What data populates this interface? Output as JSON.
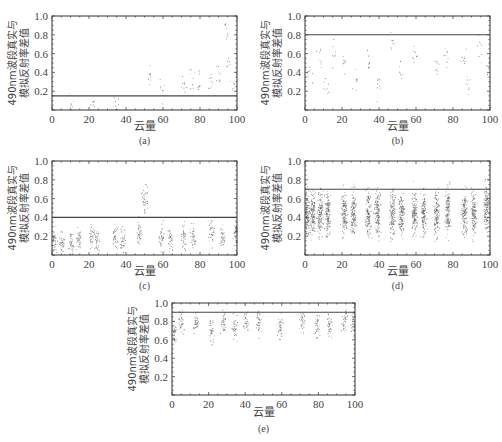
{
  "chart_data": [
    {
      "type": "scatter",
      "panel": "(a)",
      "xlabel": "云量",
      "ylabel": [
        "490nm波段真实与",
        "模拟反射率差值"
      ],
      "xlim": [
        0,
        100
      ],
      "ylim": [
        0,
        1.0
      ],
      "xticks": [
        0,
        20,
        40,
        60,
        80,
        100
      ],
      "yticks": [
        0.2,
        0.4,
        0.6,
        0.8,
        1.0
      ],
      "threshold": 0.15,
      "density": "sparse",
      "clusters": [
        [
          10,
          0.05
        ],
        [
          22,
          0.07
        ],
        [
          35,
          0.05
        ],
        [
          53,
          0.35
        ],
        [
          59,
          0.2
        ],
        [
          71,
          0.25
        ],
        [
          76,
          0.35
        ],
        [
          79,
          0.3
        ],
        [
          86,
          0.3
        ],
        [
          90,
          0.35
        ],
        [
          94,
          0.8
        ],
        [
          95,
          0.45
        ],
        [
          98,
          0.3
        ]
      ]
    },
    {
      "type": "scatter",
      "panel": "(b)",
      "xlabel": "云量",
      "ylabel": [
        "490nm波段真实与",
        "模拟反射率差值"
      ],
      "xlim": [
        0,
        100
      ],
      "ylim": [
        0,
        1.0
      ],
      "xticks": [
        0,
        20,
        40,
        60,
        80,
        100
      ],
      "yticks": [
        0.2,
        0.4,
        0.6,
        0.8,
        1.0
      ],
      "threshold": 0.8,
      "density": "sparse",
      "clusters": [
        [
          3,
          0.4
        ],
        [
          8,
          0.6
        ],
        [
          11,
          0.3
        ],
        [
          15,
          0.6
        ],
        [
          21,
          0.5
        ],
        [
          27,
          0.35
        ],
        [
          34,
          0.55
        ],
        [
          40,
          0.25
        ],
        [
          47,
          0.7
        ],
        [
          52,
          0.45
        ],
        [
          59,
          0.6
        ],
        [
          71,
          0.45
        ],
        [
          76,
          0.55
        ],
        [
          86,
          0.55
        ],
        [
          88,
          0.3
        ],
        [
          94,
          0.65
        ],
        [
          99,
          0.5
        ]
      ]
    },
    {
      "type": "scatter",
      "panel": "(c)",
      "xlabel": "云量",
      "ylabel": [
        "490nm波段真实与",
        "模拟反射率差值"
      ],
      "xlim": [
        0,
        100
      ],
      "ylim": [
        0,
        1.0
      ],
      "xticks": [
        0,
        20,
        40,
        60,
        80,
        100
      ],
      "yticks": [
        0.2,
        0.4,
        0.6,
        0.8,
        1.0
      ],
      "threshold": 0.4,
      "density": "medium",
      "clusters": [
        [
          1,
          0.15
        ],
        [
          5,
          0.15
        ],
        [
          10,
          0.12
        ],
        [
          14,
          0.15
        ],
        [
          21,
          0.2
        ],
        [
          24,
          0.15
        ],
        [
          34,
          0.2
        ],
        [
          38,
          0.15
        ],
        [
          47,
          0.25
        ],
        [
          50,
          0.6
        ],
        [
          59,
          0.2
        ],
        [
          64,
          0.15
        ],
        [
          71,
          0.2
        ],
        [
          76,
          0.2
        ],
        [
          86,
          0.25
        ],
        [
          92,
          0.2
        ],
        [
          99,
          0.25
        ]
      ]
    },
    {
      "type": "scatter",
      "panel": "(d)",
      "xlabel": "云量",
      "ylabel": [
        "490nm波段真实与",
        "模拟反射率差值"
      ],
      "xlim": [
        0,
        100
      ],
      "ylim": [
        0,
        1.0
      ],
      "xticks": [
        0,
        20,
        40,
        60,
        80,
        100
      ],
      "yticks": [
        0.2,
        0.4,
        0.6,
        0.8,
        1.0
      ],
      "threshold": 0.7,
      "density": "dense",
      "clusters": [
        [
          1,
          0.45
        ],
        [
          4,
          0.45
        ],
        [
          8,
          0.45
        ],
        [
          12,
          0.45
        ],
        [
          21,
          0.45
        ],
        [
          26,
          0.45
        ],
        [
          34,
          0.45
        ],
        [
          39,
          0.45
        ],
        [
          47,
          0.45
        ],
        [
          52,
          0.45
        ],
        [
          59,
          0.45
        ],
        [
          64,
          0.45
        ],
        [
          71,
          0.45
        ],
        [
          77,
          0.45
        ],
        [
          86,
          0.45
        ],
        [
          91,
          0.45
        ],
        [
          98,
          0.5
        ]
      ]
    },
    {
      "type": "scatter",
      "panel": "(e)",
      "xlabel": "云量",
      "ylabel": [
        "490nm波段真实与",
        "模拟反射率差值"
      ],
      "xlim": [
        0,
        100
      ],
      "ylim": [
        0,
        1.0
      ],
      "xticks": [
        0,
        20,
        40,
        60,
        80,
        100
      ],
      "yticks": [
        0.2,
        0.4,
        0.6,
        0.8,
        1.0
      ],
      "threshold": 0.9,
      "density": "medium",
      "clusters": [
        [
          1,
          0.7
        ],
        [
          5,
          0.8
        ],
        [
          13,
          0.78
        ],
        [
          21,
          0.7
        ],
        [
          28,
          0.8
        ],
        [
          34,
          0.75
        ],
        [
          40,
          0.8
        ],
        [
          47,
          0.8
        ],
        [
          59,
          0.75
        ],
        [
          71,
          0.8
        ],
        [
          79,
          0.75
        ],
        [
          86,
          0.75
        ],
        [
          94,
          0.8
        ],
        [
          99,
          0.8
        ]
      ]
    }
  ]
}
